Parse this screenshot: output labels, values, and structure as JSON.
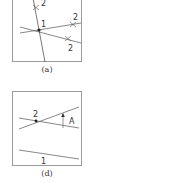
{
  "figures": [
    {
      "id": "a",
      "caption": "(a)",
      "labels": {
        "center": "1",
        "top": "2",
        "right_upper": "2",
        "right_lower": "2"
      }
    },
    {
      "id": "d",
      "caption": "(d)",
      "labels": {
        "intersection": "2",
        "angle": "A",
        "bottom_line": "1"
      }
    }
  ],
  "colors": {
    "line": "#555555",
    "border": "#9a9a9a",
    "text": "#333333"
  }
}
